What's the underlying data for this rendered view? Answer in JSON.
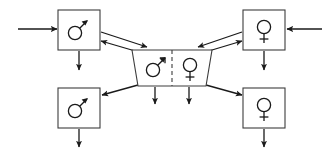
{
  "diagram": {
    "colors": {
      "stroke": "#1a1a1a",
      "box_stroke": "#3c3c3c",
      "background": "#ffffff"
    },
    "nodes": [
      {
        "id": "top-left",
        "symbol": "male",
        "symbol_glyph": "♂",
        "label": "",
        "x": 58,
        "y": 10,
        "width": 42,
        "height": 40
      },
      {
        "id": "bottom-left",
        "symbol": "male",
        "symbol_glyph": "♂",
        "label": "",
        "x": 58,
        "y": 88,
        "width": 42,
        "height": 40
      },
      {
        "id": "top-right",
        "symbol": "female",
        "symbol_glyph": "♀",
        "label": "",
        "x": 243,
        "y": 10,
        "width": 42,
        "height": 40
      },
      {
        "id": "bottom-right",
        "symbol": "female",
        "symbol_glyph": "♀",
        "label": "",
        "x": 243,
        "y": 88,
        "width": 42,
        "height": 40
      }
    ],
    "center": {
      "id": "center-compartment",
      "shape": "trapezoid",
      "left_half": {
        "symbol": "male",
        "symbol_glyph": "♂",
        "label": ""
      },
      "right_half": {
        "symbol": "female",
        "symbol_glyph": "♀",
        "label": ""
      },
      "divider": "dashed-vertical"
    },
    "edges": [
      {
        "id": "input-left",
        "from": "external-left",
        "to": "top-left",
        "kind": "inflow",
        "direction": "right"
      },
      {
        "id": "input-right",
        "from": "external-right",
        "to": "top-right",
        "kind": "inflow",
        "direction": "left"
      },
      {
        "id": "tl-to-center",
        "from": "top-left",
        "to": "center",
        "kind": "bidirectional",
        "direction": "down-right"
      },
      {
        "id": "center-to-tl",
        "from": "center",
        "to": "top-left",
        "kind": "bidirectional",
        "direction": "up-left"
      },
      {
        "id": "tr-to-center",
        "from": "top-right",
        "to": "center",
        "kind": "bidirectional",
        "direction": "down-left"
      },
      {
        "id": "center-to-tr",
        "from": "center",
        "to": "top-right",
        "kind": "bidirectional",
        "direction": "up-right"
      },
      {
        "id": "center-to-bl",
        "from": "center",
        "to": "bottom-left",
        "kind": "transition",
        "direction": "down-left"
      },
      {
        "id": "center-to-br",
        "from": "center",
        "to": "bottom-right",
        "kind": "transition",
        "direction": "down-right"
      },
      {
        "id": "out-tl",
        "from": "top-left",
        "to": "external",
        "kind": "outflow",
        "direction": "down"
      },
      {
        "id": "out-tr",
        "from": "top-right",
        "to": "external",
        "kind": "outflow",
        "direction": "down"
      },
      {
        "id": "out-bl",
        "from": "bottom-left",
        "to": "external",
        "kind": "outflow",
        "direction": "down"
      },
      {
        "id": "out-br",
        "from": "bottom-right",
        "to": "external",
        "kind": "outflow",
        "direction": "down"
      },
      {
        "id": "out-center-m",
        "from": "center-male",
        "to": "external",
        "kind": "outflow",
        "direction": "down"
      },
      {
        "id": "out-center-f",
        "from": "center-female",
        "to": "external",
        "kind": "outflow",
        "direction": "down"
      }
    ]
  }
}
